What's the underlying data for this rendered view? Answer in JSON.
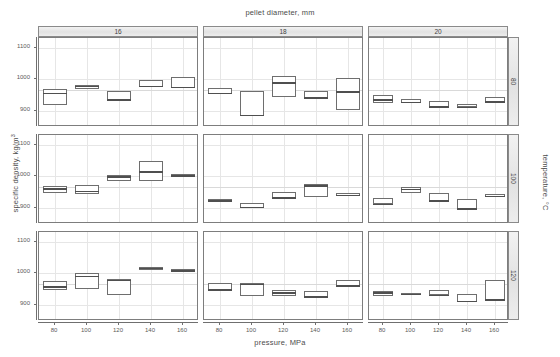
{
  "chart_data": {
    "type": "box",
    "title": "pellet diameter, mm",
    "xlabel": "pressure, MPa",
    "ylabel_main": "specific density, kg/",
    "ylabel_unit": "m",
    "ylabel_sup": "3",
    "right_label": "temperature, °C",
    "xlim": [
      70,
      170
    ],
    "ylim": [
      850,
      1130
    ],
    "xticks": [
      80,
      100,
      120,
      140,
      160
    ],
    "yticks": [
      900,
      1000,
      1100
    ],
    "xticklabels": [
      "80",
      "100",
      "120",
      "140",
      "160"
    ],
    "yticklabels": [
      "900",
      "1000",
      "1100"
    ],
    "grid": true,
    "reference_line": 965,
    "col_var": "pellet diameter, mm",
    "col_levels": [
      "16",
      "18",
      "20"
    ],
    "row_var": "temperature, °C",
    "row_levels": [
      "80",
      "100",
      "120"
    ],
    "categories": [
      80,
      100,
      120,
      140,
      160
    ],
    "panels": [
      {
        "col": "16",
        "row": "80",
        "boxes": [
          {
            "x": 80,
            "low": 918,
            "high": 968,
            "median": 957
          },
          {
            "x": 100,
            "low": 971,
            "high": 983,
            "median": 980
          },
          {
            "x": 120,
            "low": 935,
            "high": 962,
            "median": 937
          },
          {
            "x": 140,
            "low": 975,
            "high": 997,
            "median": 979
          },
          {
            "x": 160,
            "low": 972,
            "high": 1006,
            "median": 977
          }
        ]
      },
      {
        "col": "18",
        "row": "80",
        "boxes": [
          {
            "x": 80,
            "low": 955,
            "high": 973,
            "median": 957
          },
          {
            "x": 100,
            "low": 886,
            "high": 963,
            "median": 888
          },
          {
            "x": 120,
            "low": 945,
            "high": 1011,
            "median": 991
          },
          {
            "x": 140,
            "low": 940,
            "high": 963,
            "median": 944
          },
          {
            "x": 160,
            "low": 905,
            "high": 1003,
            "median": 963
          }
        ]
      },
      {
        "col": "20",
        "row": "80",
        "boxes": [
          {
            "x": 80,
            "low": 925,
            "high": 950,
            "median": 938
          },
          {
            "x": 100,
            "low": 925,
            "high": 937,
            "median": 929
          },
          {
            "x": 120,
            "low": 914,
            "high": 932,
            "median": 916
          },
          {
            "x": 140,
            "low": 913,
            "high": 921,
            "median": 914
          },
          {
            "x": 160,
            "low": 928,
            "high": 945,
            "median": 931
          }
        ]
      },
      {
        "col": "16",
        "row": "100",
        "boxes": [
          {
            "x": 80,
            "low": 947,
            "high": 970,
            "median": 963
          },
          {
            "x": 100,
            "low": 944,
            "high": 973,
            "median": 955
          },
          {
            "x": 120,
            "low": 984,
            "high": 1004,
            "median": 1000
          },
          {
            "x": 140,
            "low": 985,
            "high": 1048,
            "median": 1016
          },
          {
            "x": 160,
            "low": 1003,
            "high": 1006,
            "median": 1004
          }
        ]
      },
      {
        "col": "18",
        "row": "100",
        "boxes": [
          {
            "x": 80,
            "low": 923,
            "high": 928,
            "median": 925
          },
          {
            "x": 100,
            "low": 901,
            "high": 916,
            "median": 905
          },
          {
            "x": 120,
            "low": 930,
            "high": 950,
            "median": 934
          },
          {
            "x": 140,
            "low": 935,
            "high": 975,
            "median": 972
          },
          {
            "x": 160,
            "low": 938,
            "high": 949,
            "median": 942
          }
        ]
      },
      {
        "col": "20",
        "row": "100",
        "boxes": [
          {
            "x": 80,
            "low": 912,
            "high": 932,
            "median": 914
          },
          {
            "x": 100,
            "low": 949,
            "high": 965,
            "median": 961
          },
          {
            "x": 120,
            "low": 918,
            "high": 948,
            "median": 924
          },
          {
            "x": 140,
            "low": 898,
            "high": 929,
            "median": 900
          },
          {
            "x": 160,
            "low": 936,
            "high": 944,
            "median": 939
          }
        ]
      },
      {
        "col": "16",
        "row": "120",
        "boxes": [
          {
            "x": 80,
            "low": 946,
            "high": 975,
            "median": 959
          },
          {
            "x": 100,
            "low": 950,
            "high": 1000,
            "median": 992
          },
          {
            "x": 120,
            "low": 931,
            "high": 982,
            "median": 980
          },
          {
            "x": 140,
            "low": 1012,
            "high": 1021,
            "median": 1018
          },
          {
            "x": 160,
            "low": 1008,
            "high": 1014,
            "median": 1010
          }
        ]
      },
      {
        "col": "18",
        "row": "120",
        "boxes": [
          {
            "x": 80,
            "low": 944,
            "high": 970,
            "median": 950
          },
          {
            "x": 100,
            "low": 928,
            "high": 971,
            "median": 967
          },
          {
            "x": 120,
            "low": 928,
            "high": 946,
            "median": 941
          },
          {
            "x": 140,
            "low": 924,
            "high": 943,
            "median": 928
          },
          {
            "x": 160,
            "low": 961,
            "high": 980,
            "median": 963
          }
        ]
      },
      {
        "col": "20",
        "row": "120",
        "boxes": [
          {
            "x": 80,
            "low": 930,
            "high": 944,
            "median": 940
          },
          {
            "x": 100,
            "low": 933,
            "high": 937,
            "median": 935
          },
          {
            "x": 120,
            "low": 931,
            "high": 947,
            "median": 933
          },
          {
            "x": 140,
            "low": 909,
            "high": 936,
            "median": 913
          },
          {
            "x": 160,
            "low": 915,
            "high": 979,
            "median": 919
          }
        ]
      }
    ]
  }
}
